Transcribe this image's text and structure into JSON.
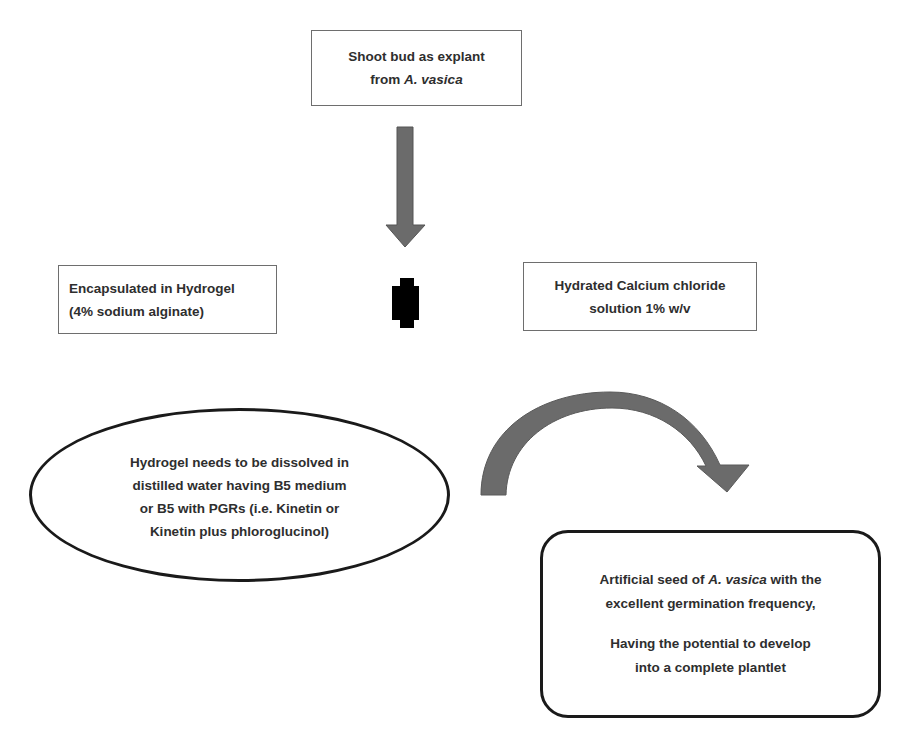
{
  "diagram": {
    "nodes": {
      "explant": {
        "line1": "Shoot bud  as explant",
        "line2_prefix": "from ",
        "line2_italic": "A. vasica"
      },
      "hydrogel": {
        "line1": "Encapsulated in Hydrogel",
        "line2": "(4% sodium alginate)"
      },
      "cacl2": {
        "line1": "Hydrated Calcium chloride",
        "line2": "solution 1% w/v"
      },
      "dissolve": {
        "lines": [
          "Hydrogel needs to be dissolved in",
          "distilled water having B5 medium",
          "or B5 with PGRs (i.e. Kinetin or",
          "Kinetin plus phloroglucinol)"
        ]
      },
      "artificial_seed": {
        "line1_prefix": "Artificial seed of ",
        "line1_italic": "A. vasica",
        "line1_suffix": " with the",
        "line2": "excellent germination frequency,",
        "line3": "Having the potential to develop",
        "line4": "into a complete plantlet"
      }
    },
    "connectors": {
      "down_arrow": {
        "color": "#6b6b6b",
        "from": "explant",
        "direction": "down"
      },
      "plus_symbol": {
        "color": "#000000",
        "meaning": "combine hydrogel with calcium chloride"
      },
      "curved_arrow": {
        "color": "#6b6b6b",
        "from": "dissolve",
        "to": "artificial_seed"
      }
    }
  }
}
